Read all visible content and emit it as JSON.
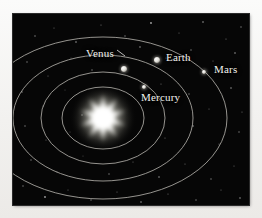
{
  "figure": {
    "kind": "solar-system-orbital-diagram",
    "background_color": "#060606",
    "page_color": "#f2f1ef",
    "orbit_color": "#b4b2ac",
    "label_color": "#f2f2ee",
    "star_color": "#ffffff"
  },
  "chart_data": {
    "type": "scatter",
    "title": "",
    "xlabel": "",
    "ylabel": "",
    "legend": "none",
    "grid": false,
    "center": {
      "name": "Sun",
      "cx": 103,
      "cy": 118,
      "points": 10,
      "outer_radius": 25,
      "inner_radius": 9
    },
    "orbits": [
      {
        "name": "Mercury orbit",
        "cx": 103,
        "cy": 118,
        "rx": 41,
        "ry": 31
      },
      {
        "name": "Venus orbit",
        "cx": 103,
        "cy": 118,
        "rx": 62,
        "ry": 46
      },
      {
        "name": "Earth orbit",
        "cx": 103,
        "cy": 118,
        "rx": 90,
        "ry": 63
      },
      {
        "name": "Mars orbit",
        "cx": 103,
        "cy": 118,
        "rx": 124,
        "ry": 81
      }
    ],
    "bodies": [
      {
        "name": "Mercury",
        "x": 144,
        "y": 87,
        "size": 4,
        "label_x": 141,
        "label_y": 92,
        "label_anchor": "left"
      },
      {
        "name": "Venus",
        "x": 124,
        "y": 69,
        "size": 6,
        "label_x": 86,
        "label_y": 48,
        "label_anchor": "left"
      },
      {
        "name": "Earth",
        "x": 157,
        "y": 60,
        "size": 6,
        "label_x": 166,
        "label_y": 52,
        "label_anchor": "left"
      },
      {
        "name": "Mars",
        "x": 204,
        "y": 72,
        "size": 4,
        "label_x": 214,
        "label_y": 64,
        "label_anchor": "left"
      }
    ],
    "leader_lines": [
      {
        "for": "Venus",
        "x1": 117,
        "y1": 50,
        "x2": 125,
        "y2": 56
      }
    ]
  },
  "labels": {
    "mercury": "Mercury",
    "venus": "Venus",
    "earth": "Earth",
    "mars": "Mars"
  },
  "stars": [
    {
      "x": 22,
      "y": 22,
      "r": 0.7,
      "o": 0.55
    },
    {
      "x": 41,
      "y": 14,
      "r": 0.6,
      "o": 0.4
    },
    {
      "x": 63,
      "y": 28,
      "r": 0.8,
      "o": 0.6
    },
    {
      "x": 88,
      "y": 11,
      "r": 0.6,
      "o": 0.45
    },
    {
      "x": 112,
      "y": 22,
      "r": 0.7,
      "o": 0.5
    },
    {
      "x": 138,
      "y": 9,
      "r": 0.9,
      "o": 0.65
    },
    {
      "x": 166,
      "y": 19,
      "r": 0.6,
      "o": 0.4
    },
    {
      "x": 190,
      "y": 8,
      "r": 0.8,
      "o": 0.6
    },
    {
      "x": 213,
      "y": 25,
      "r": 0.6,
      "o": 0.45
    },
    {
      "x": 228,
      "y": 13,
      "r": 0.7,
      "o": 0.5
    },
    {
      "x": 14,
      "y": 48,
      "r": 0.7,
      "o": 0.5
    },
    {
      "x": 35,
      "y": 62,
      "r": 0.6,
      "o": 0.4
    },
    {
      "x": 58,
      "y": 44,
      "r": 0.5,
      "o": 0.35
    },
    {
      "x": 79,
      "y": 56,
      "r": 0.7,
      "o": 0.5
    },
    {
      "x": 101,
      "y": 41,
      "r": 0.6,
      "o": 0.4
    },
    {
      "x": 127,
      "y": 33,
      "r": 0.8,
      "o": 0.55
    },
    {
      "x": 153,
      "y": 44,
      "r": 0.6,
      "o": 0.42
    },
    {
      "x": 178,
      "y": 36,
      "r": 0.7,
      "o": 0.5
    },
    {
      "x": 200,
      "y": 47,
      "r": 0.6,
      "o": 0.4
    },
    {
      "x": 222,
      "y": 39,
      "r": 0.8,
      "o": 0.58
    },
    {
      "x": 9,
      "y": 78,
      "r": 0.7,
      "o": 0.5
    },
    {
      "x": 30,
      "y": 92,
      "r": 0.6,
      "o": 0.42
    },
    {
      "x": 52,
      "y": 76,
      "r": 0.5,
      "o": 0.32
    },
    {
      "x": 69,
      "y": 101,
      "r": 0.7,
      "o": 0.48
    },
    {
      "x": 148,
      "y": 70,
      "r": 0.6,
      "o": 0.42
    },
    {
      "x": 176,
      "y": 80,
      "r": 0.7,
      "o": 0.5
    },
    {
      "x": 196,
      "y": 95,
      "r": 0.6,
      "o": 0.4
    },
    {
      "x": 218,
      "y": 74,
      "r": 0.8,
      "o": 0.55
    },
    {
      "x": 229,
      "y": 98,
      "r": 0.6,
      "o": 0.42
    },
    {
      "x": 12,
      "y": 112,
      "r": 0.7,
      "o": 0.5
    },
    {
      "x": 33,
      "y": 126,
      "r": 0.6,
      "o": 0.4
    },
    {
      "x": 57,
      "y": 118,
      "r": 0.5,
      "o": 0.32
    },
    {
      "x": 152,
      "y": 124,
      "r": 0.6,
      "o": 0.42
    },
    {
      "x": 180,
      "y": 112,
      "r": 0.8,
      "o": 0.55
    },
    {
      "x": 206,
      "y": 130,
      "r": 0.6,
      "o": 0.4
    },
    {
      "x": 226,
      "y": 118,
      "r": 0.7,
      "o": 0.5
    },
    {
      "x": 18,
      "y": 146,
      "r": 0.7,
      "o": 0.48
    },
    {
      "x": 44,
      "y": 158,
      "r": 0.6,
      "o": 0.4
    },
    {
      "x": 70,
      "y": 142,
      "r": 0.5,
      "o": 0.33
    },
    {
      "x": 96,
      "y": 160,
      "r": 0.7,
      "o": 0.5
    },
    {
      "x": 120,
      "y": 148,
      "r": 0.6,
      "o": 0.4
    },
    {
      "x": 146,
      "y": 163,
      "r": 0.8,
      "o": 0.55
    },
    {
      "x": 172,
      "y": 150,
      "r": 0.6,
      "o": 0.42
    },
    {
      "x": 198,
      "y": 165,
      "r": 0.7,
      "o": 0.5
    },
    {
      "x": 221,
      "y": 152,
      "r": 0.6,
      "o": 0.4
    },
    {
      "x": 10,
      "y": 172,
      "r": 0.7,
      "o": 0.5
    },
    {
      "x": 32,
      "y": 183,
      "r": 0.9,
      "o": 0.62
    },
    {
      "x": 55,
      "y": 176,
      "r": 0.6,
      "o": 0.4
    },
    {
      "x": 78,
      "y": 186,
      "r": 0.7,
      "o": 0.48
    },
    {
      "x": 104,
      "y": 178,
      "r": 0.6,
      "o": 0.4
    },
    {
      "x": 128,
      "y": 188,
      "r": 0.8,
      "o": 0.58
    },
    {
      "x": 155,
      "y": 180,
      "r": 0.6,
      "o": 0.42
    },
    {
      "x": 183,
      "y": 186,
      "r": 0.7,
      "o": 0.5
    },
    {
      "x": 208,
      "y": 176,
      "r": 0.6,
      "o": 0.4
    },
    {
      "x": 227,
      "y": 184,
      "r": 0.8,
      "o": 0.55
    }
  ]
}
